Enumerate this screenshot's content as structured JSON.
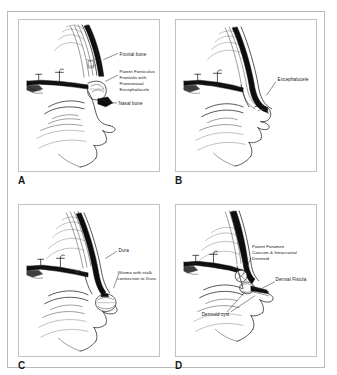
{
  "figure": {
    "type": "medical-line-illustration",
    "panel_count": 4
  },
  "panels": [
    {
      "id": "A",
      "letter": "A",
      "labels": [
        {
          "name": "frontal-bone",
          "text": "Frontal bone"
        },
        {
          "name": "patent-fonticulus",
          "text": "Patent Fonticulus\nFrontalis with\nFrontonasal\nEncephalocele",
          "lines": [
            "Patent Fonticulus",
            "Frontalis with",
            "Frontonasal",
            "Encephalocele"
          ]
        },
        {
          "name": "nasal-bone",
          "text": "Nasal bone"
        }
      ]
    },
    {
      "id": "B",
      "letter": "B",
      "labels": [
        {
          "name": "encephalocele",
          "text": "Encephalocele",
          "lines": [
            "Encephalocele"
          ]
        }
      ]
    },
    {
      "id": "C",
      "letter": "C",
      "labels": [
        {
          "name": "dura",
          "text": "Dura",
          "lines": [
            "Dura"
          ]
        },
        {
          "name": "glioma",
          "text": "Glioma with stalk connection to Dura",
          "lines": [
            "Glioma with stalk",
            "connection to Dura"
          ]
        }
      ]
    },
    {
      "id": "D",
      "letter": "D",
      "labels": [
        {
          "name": "patent-foramen-caecum",
          "text": "Patent Foramen Caecum & Intracranial Dermoid",
          "lines": [
            "Patent Foramen",
            "Caecum & Intracranial",
            "Dermoid"
          ]
        },
        {
          "name": "dermal-fistula",
          "text": "Dermal Fistula",
          "lines": [
            "Dermal Fistula"
          ]
        },
        {
          "name": "dermoid-cyst",
          "text": "Dermoid cyst",
          "lines": [
            "Dermoid cyst"
          ]
        }
      ]
    }
  ],
  "colors": {
    "background": "#ffffff",
    "ink": "#111111",
    "bone_fill": "#0d0d0d",
    "frame": "#b9b9b9",
    "panel_border": "#c2c2c2"
  }
}
